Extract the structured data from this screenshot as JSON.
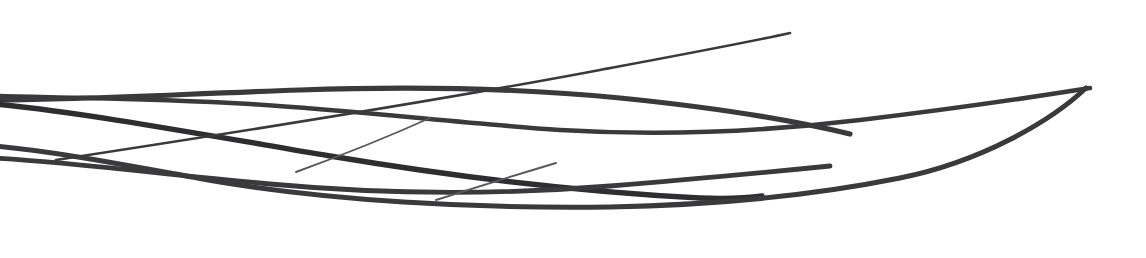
{
  "artwork": {
    "title": "Abstract Flowing Ribbon Curves",
    "alt_text": "Decorative abstract line artwork of several thin dark-gray curved strands sweeping horizontally across a white field, converging at the left edge and fanning out toward the right.",
    "canvas": {
      "width": 1146,
      "height": 258
    },
    "background_color": "#ffffff",
    "stroke_color": "#3a3a3c",
    "stroke_color_light": "#58585b",
    "stroke_color_dark": "#2e2e30",
    "style": "line-art",
    "curve_count": 7,
    "strokes": [
      {
        "name": "upper-sweeping-arc",
        "weight": 4.6,
        "color": "#3a3a3c",
        "d": "M -6 96 C 60 98, 150 98, 250 104 C 350 110, 470 124, 560 130 C 660 136, 760 132, 860 120 C 960 108, 1040 96, 1090 88"
      },
      {
        "name": "crest-arc-over-top",
        "weight": 5.2,
        "color": "#3a3a3c",
        "d": "M -6 100 C 80 100, 180 94, 300 90 C 420 86, 520 88, 620 98 C 720 108, 800 122, 850 134"
      },
      {
        "name": "descending-diagonal-ribbon",
        "weight": 5.4,
        "color": "#2e2e30",
        "d": "M -6 104 C 80 112, 200 134, 330 156 C 450 176, 580 192, 700 198 C 730 199, 748 198, 762 196"
      },
      {
        "name": "lower-deep-belly-curve",
        "weight": 5.0,
        "color": "#3a3a3c",
        "d": "M -6 146 C 60 152, 130 166, 220 182 C 330 200, 470 209, 610 207 C 720 205, 820 194, 900 178 C 980 162, 1050 122, 1086 88"
      },
      {
        "name": "mid-horizontal-ribbon",
        "weight": 4.8,
        "color": "#3a3a3c",
        "d": "M -6 158 C 70 162, 160 174, 270 184 C 390 195, 510 194, 610 186 C 700 179, 770 172, 830 166"
      },
      {
        "name": "rising-diagonal-line",
        "weight": 2.6,
        "color": "#3a3a3c",
        "d": "M 56 160 C 200 138, 420 104, 600 70 C 680 55, 750 42, 790 33"
      },
      {
        "name": "short-thin-accent-upper",
        "weight": 1.9,
        "color": "#58585b",
        "d": "M 296 172 C 340 156, 390 136, 430 118"
      },
      {
        "name": "short-thin-accent-lower",
        "weight": 1.9,
        "color": "#58585b",
        "d": "M 436 200 C 480 186, 526 172, 556 163"
      }
    ]
  }
}
